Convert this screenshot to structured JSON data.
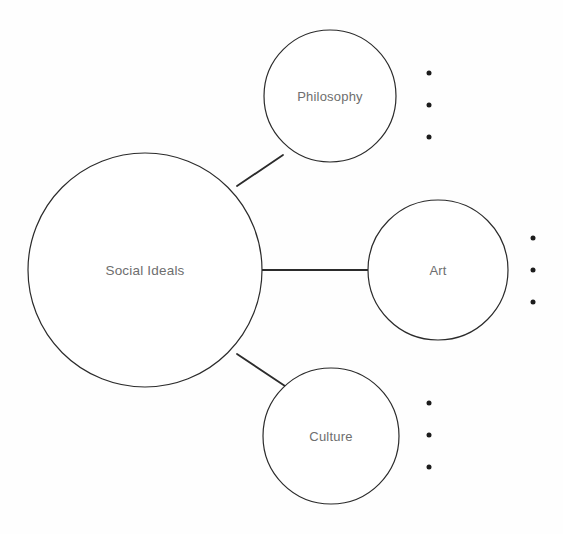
{
  "diagram": {
    "type": "radial-bubble-map",
    "background_color": "#fefefe",
    "stroke_color": "#2b2b2b",
    "label_color": "#6e6e6e",
    "bullet_color": "#1c1c1c",
    "root": {
      "label": "Social Ideals",
      "cx": 145,
      "cy": 270,
      "r": 117
    },
    "branches": [
      {
        "id": "philosophy",
        "label": "Philosophy",
        "cx": 330,
        "cy": 96,
        "r": 66,
        "connector": {
          "x1": 237,
          "y1": 186,
          "x2": 283,
          "y2": 155
        },
        "bullets": [
          {
            "cx": 429,
            "cy": 73
          },
          {
            "cx": 429,
            "cy": 105
          },
          {
            "cx": 429,
            "cy": 137
          }
        ]
      },
      {
        "id": "art",
        "label": "Art",
        "cx": 438,
        "cy": 270,
        "r": 70,
        "connector": {
          "x1": 262,
          "y1": 270,
          "x2": 368,
          "y2": 270
        },
        "bullets": [
          {
            "cx": 533,
            "cy": 238
          },
          {
            "cx": 533,
            "cy": 270
          },
          {
            "cx": 533,
            "cy": 302
          }
        ]
      },
      {
        "id": "culture",
        "label": "Culture",
        "cx": 331,
        "cy": 436,
        "r": 68,
        "connector": {
          "x1": 237,
          "y1": 354,
          "x2": 285,
          "y2": 386
        },
        "bullets": [
          {
            "cx": 429,
            "cy": 403
          },
          {
            "cx": 429,
            "cy": 435
          },
          {
            "cx": 429,
            "cy": 467
          }
        ]
      }
    ]
  }
}
